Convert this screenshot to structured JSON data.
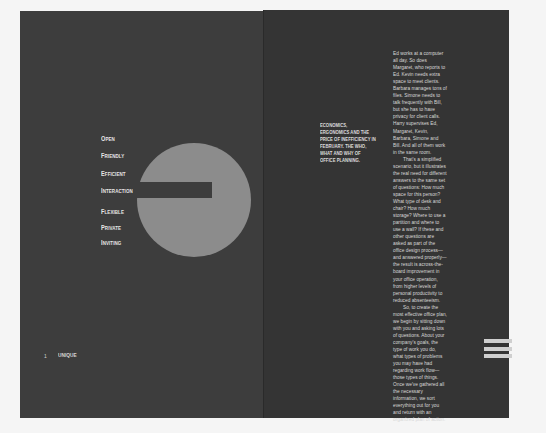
{
  "spread": {
    "background": "#f5f5f5",
    "left_page_color": "#3d3d3d",
    "right_page_color": "#343434"
  },
  "left_page": {
    "attributes": [
      {
        "cap": "O",
        "rest": "PEN"
      },
      {
        "cap": "F",
        "rest": "RIENDLY"
      },
      {
        "cap": "E",
        "rest": "FFICIENT"
      },
      {
        "cap": "I",
        "rest": "NTERACTION"
      },
      {
        "cap": "F",
        "rest": "LEXIBLE"
      },
      {
        "cap": "P",
        "rest": "RIVATE"
      },
      {
        "cap": "I",
        "rest": "NVITING"
      }
    ],
    "graphic": {
      "shape": "circle-with-bar",
      "circle_color": "#8c8c8c",
      "bar_color": "#3d3d3d"
    },
    "footer": {
      "page_number": "1",
      "label": "UNIQUE"
    }
  },
  "right_page": {
    "headline": "ECONOMICS, ERGONOMICS AND THE PRICE OF INEFFICIENCY IN FEBRUARY. THE WHO, WHAT AND WHY OF OFFICE PLANNING.",
    "body_paragraphs": [
      "Ed works at a computer all day. So does Margaret, who reports to Ed. Kevin needs extra space to meet clients. Barbara manages tons of files. Simone needs to talk frequently with Bill, but she has to have privacy for client calls. Harry supervises Ed, Margaret, Kevin, Barbara, Simone and Bill. And all of them work in the same room.",
      "That's a simplified scenario, but it illustrates the real need for different answers to the same set of questions: How much space for this person? What type of desk and chair? How much storage? Where to use a partition and where to use a wall? If these and other questions are asked as part of the office design process—and answered properly—the result is across-the-board improvement in your office operation, from higher levels of personal productivity to reduced absenteeism.",
      "So, to create the most effective office plan, we begin by sitting down with you and asking lots of questions. About your company's goals, the type of work you do, what types of problems you may have had regarding work flow—those types of things. Once we've gathered all the necessary information, we sort everything out for you and return with an organized plan of action."
    ],
    "stripes_icon": {
      "count": 3,
      "color": "#cfcfcf"
    }
  }
}
